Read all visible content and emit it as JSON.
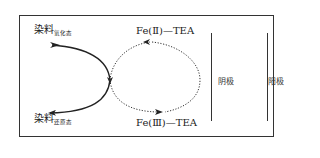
{
  "diagram": {
    "type": "redox-cycle",
    "dye": {
      "oxidized": {
        "main": "染料",
        "sub": "氧化态"
      },
      "reduced": {
        "main": "染料",
        "sub": "还原态"
      }
    },
    "mediator": {
      "fe2": "Fe(Ⅱ)—TEA",
      "fe3": "Fe(Ⅲ)—TEA"
    },
    "electrodes": {
      "cathode": "阴极",
      "anode": "阳极"
    },
    "colors": {
      "line": "#333333",
      "background": "#ffffff"
    }
  }
}
